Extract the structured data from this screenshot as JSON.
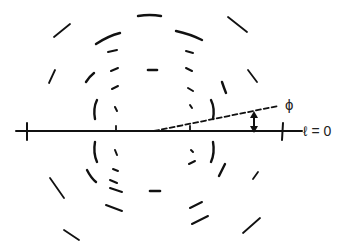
{
  "diagram": {
    "title": "",
    "labels": {
      "phi": "ϕ",
      "layer_line": "ℓ = 0"
    },
    "colors": {
      "stroke": "#111111",
      "background": "#ffffff"
    },
    "center": [
      153,
      131
    ],
    "elements": {
      "equator_line": "horizontal layer line ℓ = 0",
      "tilt_line": "dashed line at angle ϕ",
      "arrow": "double-headed vertical arrow indicating tilt"
    }
  }
}
